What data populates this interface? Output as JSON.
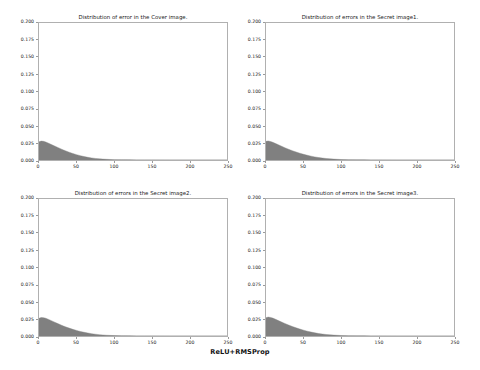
{
  "figure": {
    "caption": "ReLU+RMSProp",
    "background_color": "#ffffff",
    "axis_color": "#b0b0b0",
    "fill_color": "#808080",
    "text_color": "#1a1a1a"
  },
  "chart_data": [
    {
      "type": "area",
      "title": "Distribution of error in the Cover image.",
      "xlabel": "",
      "ylabel": "",
      "xlim": [
        0,
        250
      ],
      "ylim": [
        0.0,
        0.2
      ],
      "grid": false,
      "legend": "none",
      "xticks": [
        0,
        50,
        100,
        150,
        200,
        250
      ],
      "xtick_labels": [
        "0",
        "50",
        "100",
        "150",
        "200",
        "250"
      ],
      "yticks": [
        0.0,
        0.025,
        0.05,
        0.075,
        0.1,
        0.125,
        0.15,
        0.175,
        0.2
      ],
      "ytick_labels": [
        "0.000",
        "0.025",
        "0.050",
        "0.075",
        "0.100",
        "0.125",
        "0.150",
        "0.175",
        "0.200"
      ],
      "x": [
        0,
        3,
        6,
        9,
        12,
        15,
        20,
        25,
        30,
        35,
        40,
        45,
        50,
        55,
        60,
        65,
        70,
        75,
        80,
        85,
        90,
        100,
        110,
        120,
        130,
        140,
        150,
        175,
        200,
        225,
        250
      ],
      "values": [
        0.0265,
        0.0276,
        0.0272,
        0.0262,
        0.0248,
        0.0233,
        0.0208,
        0.0183,
        0.0158,
        0.0135,
        0.0114,
        0.0095,
        0.0078,
        0.0063,
        0.005,
        0.0039,
        0.003,
        0.0023,
        0.0017,
        0.0013,
        0.001,
        0.0005,
        0.0003,
        0.0002,
        0.0001,
        0.0001,
        0.0001,
        0.0,
        0.0,
        0.0,
        0.0
      ]
    },
    {
      "type": "area",
      "title": "Distribution of errors in the Secret image1.",
      "xlabel": "",
      "ylabel": "",
      "xlim": [
        0,
        250
      ],
      "ylim": [
        0.0,
        0.2
      ],
      "grid": false,
      "legend": "none",
      "xticks": [
        0,
        50,
        100,
        150,
        200,
        250
      ],
      "xtick_labels": [
        "0",
        "50",
        "100",
        "150",
        "200",
        "250"
      ],
      "yticks": [
        0.0,
        0.025,
        0.05,
        0.075,
        0.1,
        0.125,
        0.15,
        0.175,
        0.2
      ],
      "ytick_labels": [
        "0.000",
        "0.025",
        "0.050",
        "0.075",
        "0.100",
        "0.125",
        "0.150",
        "0.175",
        "0.200"
      ],
      "x": [
        0,
        3,
        6,
        9,
        12,
        15,
        20,
        25,
        30,
        35,
        40,
        45,
        50,
        55,
        60,
        65,
        70,
        75,
        80,
        85,
        90,
        100,
        110,
        120,
        130,
        140,
        150,
        175,
        200,
        225,
        250
      ],
      "values": [
        0.0272,
        0.0278,
        0.027,
        0.0258,
        0.0244,
        0.0229,
        0.0204,
        0.018,
        0.0157,
        0.0136,
        0.0117,
        0.0099,
        0.0083,
        0.0069,
        0.0056,
        0.0045,
        0.0036,
        0.0028,
        0.0022,
        0.0017,
        0.0013,
        0.0007,
        0.0004,
        0.0002,
        0.0002,
        0.0001,
        0.0001,
        0.0,
        0.0,
        0.0,
        0.0
      ]
    },
    {
      "type": "area",
      "title": "Distribution of errors in the Secret image2.",
      "xlabel": "",
      "ylabel": "",
      "xlim": [
        0,
        250
      ],
      "ylim": [
        0.0,
        0.2
      ],
      "grid": false,
      "legend": "none",
      "xticks": [
        0,
        50,
        100,
        150,
        200,
        250
      ],
      "xtick_labels": [
        "0",
        "50",
        "100",
        "150",
        "200",
        "250"
      ],
      "yticks": [
        0.0,
        0.025,
        0.05,
        0.075,
        0.1,
        0.125,
        0.15,
        0.175,
        0.2
      ],
      "ytick_labels": [
        "0.000",
        "0.025",
        "0.050",
        "0.075",
        "0.100",
        "0.125",
        "0.150",
        "0.175",
        "0.200"
      ],
      "x": [
        0,
        3,
        6,
        9,
        12,
        15,
        20,
        25,
        30,
        35,
        40,
        45,
        50,
        55,
        60,
        65,
        70,
        75,
        80,
        85,
        90,
        100,
        110,
        120,
        130,
        140,
        150,
        175,
        200,
        225,
        250
      ],
      "values": [
        0.0258,
        0.027,
        0.0268,
        0.0259,
        0.0246,
        0.0231,
        0.0206,
        0.0181,
        0.0157,
        0.0135,
        0.0115,
        0.0097,
        0.0081,
        0.0066,
        0.0054,
        0.0043,
        0.0034,
        0.0026,
        0.002,
        0.0015,
        0.0011,
        0.0006,
        0.0003,
        0.0002,
        0.0001,
        0.0001,
        0.0001,
        0.0,
        0.0,
        0.0,
        0.0
      ]
    },
    {
      "type": "area",
      "title": "Distribution of errors in the Secret image3.",
      "xlabel": "",
      "ylabel": "",
      "xlim": [
        0,
        250
      ],
      "ylim": [
        0.0,
        0.2
      ],
      "grid": false,
      "legend": "none",
      "xticks": [
        0,
        50,
        100,
        150,
        200,
        250
      ],
      "xtick_labels": [
        "0",
        "50",
        "100",
        "150",
        "200",
        "250"
      ],
      "yticks": [
        0.0,
        0.025,
        0.05,
        0.075,
        0.1,
        0.125,
        0.15,
        0.175,
        0.2
      ],
      "ytick_labels": [
        "0.000",
        "0.025",
        "0.050",
        "0.075",
        "0.100",
        "0.125",
        "0.150",
        "0.175",
        "0.200"
      ],
      "x": [
        0,
        3,
        6,
        9,
        12,
        15,
        20,
        25,
        30,
        35,
        40,
        45,
        50,
        55,
        60,
        65,
        70,
        75,
        80,
        85,
        90,
        100,
        110,
        120,
        130,
        140,
        150,
        175,
        200,
        225,
        250
      ],
      "values": [
        0.0268,
        0.0276,
        0.0271,
        0.0261,
        0.0247,
        0.0232,
        0.0207,
        0.0183,
        0.016,
        0.0139,
        0.0119,
        0.0101,
        0.0085,
        0.007,
        0.0057,
        0.0046,
        0.0036,
        0.0028,
        0.0022,
        0.0017,
        0.0013,
        0.0007,
        0.0004,
        0.0002,
        0.0002,
        0.0001,
        0.0001,
        0.0,
        0.0,
        0.0,
        0.0
      ]
    }
  ]
}
